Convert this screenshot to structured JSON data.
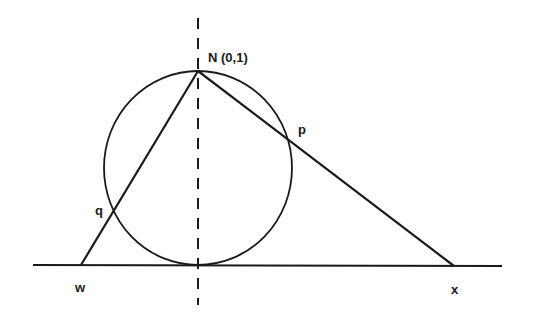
{
  "diagram": {
    "type": "stereographic-projection",
    "labels": {
      "north_pole": "N (0,1)",
      "point_p": "p",
      "point_q": "q",
      "point_w": "w",
      "point_x": "x"
    },
    "colors": {
      "ink": "#1a1a1a",
      "background": "#ffffff"
    }
  }
}
